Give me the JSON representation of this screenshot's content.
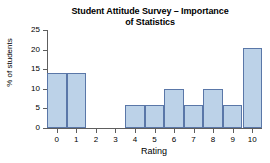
{
  "chart_data": {
    "type": "bar",
    "title": "Student Attitude Survey – Importance\nof Statistics",
    "title_line1": "Student Attitude Survey – Importance",
    "title_line2": "of Statistics",
    "xlabel": "Rating",
    "ylabel": "% of students",
    "categories": [
      "0",
      "1",
      "2",
      "3",
      "4",
      "5",
      "6",
      "7",
      "8",
      "9",
      "10"
    ],
    "values": [
      14,
      14,
      0,
      0,
      6,
      6,
      10,
      6,
      10,
      6,
      20.5
    ],
    "ylim": [
      0,
      25
    ],
    "yticks": [
      0,
      5,
      10,
      15,
      20,
      25
    ],
    "ytick_labels": [
      "0",
      "5",
      "10",
      "15",
      "20",
      "25"
    ],
    "xlim": [
      -0.5,
      10.5
    ],
    "grid": false,
    "legend": null,
    "bar_fill_color": "#bcd2e8",
    "bar_edge_color": "#5a77a8",
    "axis_color": "#5e5e5e",
    "background_color": "#ffffff"
  }
}
